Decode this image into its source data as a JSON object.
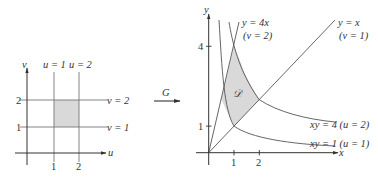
{
  "left_diagram": {
    "axis_labels": {
      "horizontal": "u",
      "vertical": "v"
    },
    "tick_labels": {
      "u": [
        "1",
        "2"
      ],
      "v": [
        "1",
        "2"
      ]
    },
    "line_labels": {
      "u1": "u = 1",
      "u2": "u = 2",
      "v1": "v = 1",
      "v2": "v = 2"
    },
    "region_fill": "#d9d9d9"
  },
  "mapping": {
    "label": "G"
  },
  "right_diagram": {
    "axis_labels": {
      "horizontal": "x",
      "vertical": "y"
    },
    "tick_labels": {
      "x": [
        "1",
        "2"
      ],
      "y": [
        "1",
        "4"
      ]
    },
    "region_label": "𝒟",
    "region_fill": "#d9d9d9",
    "curve_labels": {
      "y4x": "y = 4x",
      "y4x_param": "(v = 2)",
      "yx": "y = x",
      "yx_param": "(v = 1)",
      "xy4": "xy = 4 (u = 2)",
      "xy1": "xy = 1 (u = 1)"
    }
  },
  "colors": {
    "line": "#555555",
    "text": "#333333",
    "shade": "#d9d9d9"
  }
}
